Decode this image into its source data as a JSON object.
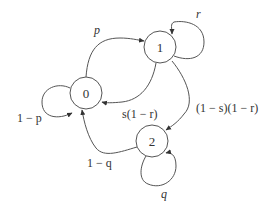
{
  "diagram": {
    "type": "markov-chain",
    "nodes": [
      {
        "id": "0",
        "label": "0",
        "cx": 86,
        "cy": 93
      },
      {
        "id": "1",
        "label": "1",
        "cx": 160,
        "cy": 47
      },
      {
        "id": "2",
        "label": "2",
        "cx": 152,
        "cy": 141
      }
    ],
    "edges": [
      {
        "from": "0",
        "to": "1",
        "label": "p"
      },
      {
        "from": "0",
        "to": "0",
        "label": "1 − p"
      },
      {
        "from": "1",
        "to": "1",
        "label": "r"
      },
      {
        "from": "1",
        "to": "0",
        "label": "s(1 − r)"
      },
      {
        "from": "1",
        "to": "2",
        "label": "(1 − s)(1 − r)"
      },
      {
        "from": "2",
        "to": "0",
        "label": "1 − q"
      },
      {
        "from": "2",
        "to": "2",
        "label": "q"
      }
    ],
    "colors": {
      "stroke": "#555555",
      "text": "#333333",
      "background": "#ffffff"
    }
  }
}
